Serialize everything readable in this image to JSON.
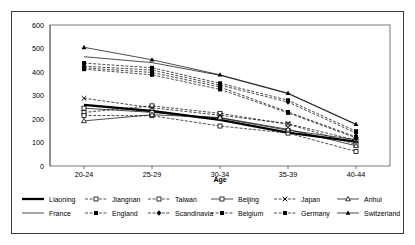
{
  "chart_data": {
    "type": "line",
    "title": "",
    "xlabel": "Age",
    "ylabel": "",
    "categories": [
      "20-24",
      "25-29",
      "30-34",
      "35-39",
      "40-44"
    ],
    "ylim": [
      0,
      600
    ],
    "ytick_step": 100,
    "yticks": [
      "0",
      "100",
      "200",
      "300",
      "400",
      "500",
      "600"
    ],
    "grid": false,
    "legend_position": "bottom",
    "series": [
      {
        "name": "Liaoning",
        "values": [
          260,
          234,
          196,
          142,
          104
        ],
        "marker": "none",
        "line": "thick-solid"
      },
      {
        "name": "Jiangnan",
        "values": [
          228,
          256,
          224,
          178,
          92
        ],
        "marker": "open-square",
        "line": "dashed"
      },
      {
        "name": "Taiwan",
        "values": [
          215,
          214,
          170,
          140,
          62
        ],
        "marker": "open-square",
        "line": "dashed"
      },
      {
        "name": "Beijing",
        "values": [
          246,
          228,
          204,
          152,
          112
        ],
        "marker": "open-square",
        "line": "solid-thin"
      },
      {
        "name": "Japan",
        "values": [
          288,
          248,
          216,
          180,
          110
        ],
        "marker": "cross",
        "line": "dashed"
      },
      {
        "name": "Anhui",
        "values": [
          192,
          218,
          206,
          156,
          86
        ],
        "marker": "triangle",
        "line": "solid-thin"
      },
      {
        "name": "France",
        "values": [
          465,
          440,
          386,
          308,
          176
        ],
        "marker": "none",
        "line": "solid-thin"
      },
      {
        "name": "England",
        "values": [
          418,
          398,
          336,
          230,
          124
        ],
        "marker": "filled-square",
        "line": "dashed"
      },
      {
        "name": "Scandinavia",
        "values": [
          425,
          408,
          344,
          272,
          140
        ],
        "marker": "filled-diamond",
        "line": "dashed"
      },
      {
        "name": "Belgium",
        "values": [
          412,
          388,
          326,
          226,
          120
        ],
        "marker": "filled-square",
        "line": "dashed"
      },
      {
        "name": "Germany",
        "values": [
          438,
          418,
          352,
          280,
          148
        ],
        "marker": "filled-square",
        "line": "dashed"
      },
      {
        "name": "Switzerland",
        "values": [
          505,
          452,
          388,
          310,
          178
        ],
        "marker": "filled-triangle",
        "line": "solid-thin"
      }
    ]
  },
  "legend": {
    "row1": [
      "Liaoning",
      "Jiangnan",
      "Taiwan",
      "Beijing",
      "Japan",
      "Anhui"
    ],
    "row2": [
      "France",
      "England",
      "Scandinavia",
      "Belgium",
      "Germany",
      "Switzerland"
    ]
  },
  "colors": {
    "line": "#000000",
    "frame": "#3a3a3a",
    "background": "#ffffff",
    "text": "#000000"
  }
}
